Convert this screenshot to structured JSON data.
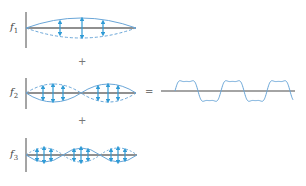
{
  "diagram": {
    "colors": {
      "curve": "#6aa6d8",
      "arrow": "#2f9bd6",
      "baseline": "#6b6b6b",
      "axis": "#4a4a4a",
      "operator": "#888888"
    },
    "harmonics": [
      {
        "label": "f",
        "subscript": "1",
        "loops": 1
      },
      {
        "label": "f",
        "subscript": "2",
        "loops": 2
      },
      {
        "label": "f",
        "subscript": "3",
        "loops": 3
      }
    ],
    "operators": {
      "plus_1": "+",
      "plus_2": "+",
      "equals": "="
    },
    "result": {
      "description": "resultant complex waveform (sum of f1, f2, f3)",
      "periods": 2.6
    }
  }
}
